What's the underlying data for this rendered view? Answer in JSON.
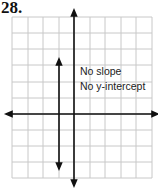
{
  "problem_number": "28.",
  "graph": {
    "x_cells": 9,
    "y_cells": 10,
    "grid_color": "#c8c8c8",
    "axis_color": "#111111",
    "annotation_lines": [
      "No slope",
      "No y-intercept"
    ],
    "plotted_line": {
      "type": "vertical",
      "x": -1
    }
  }
}
